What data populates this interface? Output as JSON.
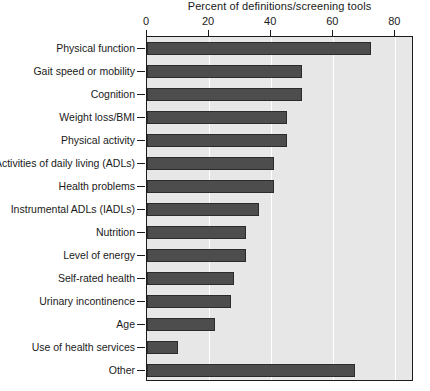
{
  "chart_data": {
    "type": "bar",
    "orientation": "horizontal",
    "title": "Percent of definitions/screening tools",
    "xlabel": "",
    "ylabel": "",
    "xlim": [
      0,
      86
    ],
    "xticks": [
      0,
      20,
      40,
      60,
      80
    ],
    "xtick_labels": [
      "0",
      "20",
      "40",
      "60",
      "80"
    ],
    "grid": "vertical-white-gridlines",
    "legend": "none",
    "categories": [
      "Physical function",
      "Gait speed or mobility",
      "Cognition",
      "Weight loss/BMI",
      "Physical activity",
      "Activities of daily living (ADLs)",
      "Health problems",
      "Instrumental ADLs (IADLs)",
      "Nutrition",
      "Level of energy",
      "Self-rated health",
      "Urinary incontinence",
      "Age",
      "Use of health services",
      "Other"
    ],
    "values": [
      72,
      50,
      50,
      45,
      45,
      41,
      41,
      36,
      32,
      32,
      28,
      27,
      22,
      10,
      67
    ],
    "bar_color": "#4d4d4d",
    "plot_background": "#e7e7e7",
    "gridline_color": "#ffffff",
    "axis_color": "#1c1c1c"
  }
}
